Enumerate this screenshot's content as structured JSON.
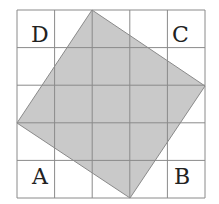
{
  "figure": {
    "grid": {
      "cols": 5,
      "rows": 5,
      "x0": 17,
      "y0": 10,
      "cell": 37.6,
      "line_color": "#8a8a8a"
    },
    "shape": {
      "fill": "#c9c9c9",
      "stroke": "#8a8a8a",
      "points": "92,10 205,86 130,198 17,123"
    },
    "labels": {
      "top_left": "D",
      "top_right": "C",
      "bottom_left": "A",
      "bottom_right": "B"
    }
  }
}
